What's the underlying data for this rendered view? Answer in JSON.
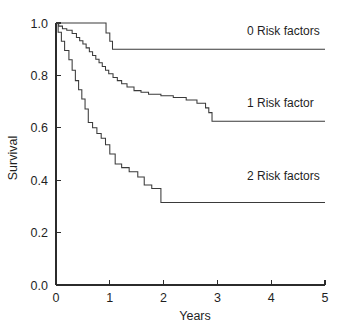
{
  "chart_data": {
    "type": "line",
    "subtype": "kaplan-meier-step",
    "title": "",
    "xlabel": "Years",
    "ylabel": "Survival",
    "xlim": [
      0,
      5
    ],
    "ylim": [
      0.0,
      1.0
    ],
    "xticks": [
      0,
      1,
      2,
      3,
      4,
      5
    ],
    "xticklabels": [
      "0",
      "1",
      "2",
      "3",
      "4",
      "5"
    ],
    "yticks": [
      0.0,
      0.2,
      0.4,
      0.6,
      0.8,
      1.0
    ],
    "yticklabels": [
      "0.0",
      "0.2",
      "0.4",
      "0.6",
      "0.8",
      "1.0"
    ],
    "grid": false,
    "frame": "left-bottom-only",
    "legend_position": "inline-right-of-curve",
    "line_color": "#3a3a3a",
    "axis_color": "#2b2b2b",
    "background": "#ffffff",
    "series": [
      {
        "name": "0 Risk factors",
        "label": "0 Risk factors",
        "label_x": 3.55,
        "label_y": 0.955,
        "final_survival": 0.9,
        "x": [
          0.0,
          0.93,
          0.93,
          1.0,
          1.0,
          1.05,
          1.05,
          5.0
        ],
        "y": [
          1.0,
          1.0,
          0.962,
          0.962,
          0.93,
          0.93,
          0.9,
          0.9
        ]
      },
      {
        "name": "1 Risk factor",
        "label": "1 Risk factor",
        "label_x": 3.55,
        "label_y": 0.68,
        "final_survival": 0.625,
        "x": [
          0.0,
          0.05,
          0.05,
          0.12,
          0.12,
          0.2,
          0.2,
          0.3,
          0.3,
          0.38,
          0.38,
          0.44,
          0.44,
          0.5,
          0.5,
          0.56,
          0.56,
          0.62,
          0.62,
          0.68,
          0.68,
          0.74,
          0.74,
          0.8,
          0.8,
          0.86,
          0.86,
          0.92,
          0.92,
          0.98,
          0.98,
          1.06,
          1.06,
          1.14,
          1.14,
          1.22,
          1.22,
          1.32,
          1.32,
          1.45,
          1.45,
          1.58,
          1.58,
          1.72,
          1.72,
          1.95,
          1.95,
          2.18,
          2.18,
          2.42,
          2.42,
          2.62,
          2.62,
          2.78,
          2.78,
          2.84,
          2.84,
          2.9,
          2.9,
          5.0
        ],
        "y": [
          1.0,
          1.0,
          0.988,
          0.988,
          0.978,
          0.978,
          0.972,
          0.972,
          0.96,
          0.96,
          0.945,
          0.945,
          0.932,
          0.932,
          0.92,
          0.92,
          0.905,
          0.905,
          0.89,
          0.89,
          0.876,
          0.876,
          0.862,
          0.862,
          0.848,
          0.848,
          0.834,
          0.834,
          0.82,
          0.82,
          0.806,
          0.806,
          0.792,
          0.792,
          0.78,
          0.78,
          0.768,
          0.768,
          0.756,
          0.756,
          0.742,
          0.742,
          0.736,
          0.736,
          0.728,
          0.728,
          0.722,
          0.722,
          0.716,
          0.716,
          0.706,
          0.706,
          0.694,
          0.694,
          0.676,
          0.676,
          0.658,
          0.658,
          0.625,
          0.625
        ]
      },
      {
        "name": "2 Risk factors",
        "label": "2 Risk factors",
        "label_x": 3.55,
        "label_y": 0.4,
        "final_survival": 0.315,
        "x": [
          0.0,
          0.04,
          0.04,
          0.1,
          0.1,
          0.16,
          0.16,
          0.24,
          0.24,
          0.3,
          0.3,
          0.36,
          0.36,
          0.42,
          0.42,
          0.48,
          0.48,
          0.54,
          0.54,
          0.6,
          0.6,
          0.68,
          0.68,
          0.76,
          0.76,
          0.84,
          0.84,
          0.92,
          0.92,
          1.0,
          1.0,
          1.1,
          1.1,
          1.22,
          1.22,
          1.36,
          1.36,
          1.52,
          1.52,
          1.64,
          1.64,
          1.78,
          1.78,
          1.95,
          1.95,
          5.0
        ],
        "y": [
          1.0,
          1.0,
          0.965,
          0.965,
          0.93,
          0.93,
          0.895,
          0.895,
          0.86,
          0.86,
          0.82,
          0.82,
          0.78,
          0.78,
          0.745,
          0.745,
          0.71,
          0.71,
          0.672,
          0.672,
          0.62,
          0.62,
          0.6,
          0.6,
          0.578,
          0.578,
          0.56,
          0.56,
          0.535,
          0.535,
          0.5,
          0.5,
          0.462,
          0.462,
          0.448,
          0.448,
          0.432,
          0.432,
          0.412,
          0.412,
          0.382,
          0.382,
          0.368,
          0.368,
          0.315,
          0.315
        ]
      }
    ]
  }
}
